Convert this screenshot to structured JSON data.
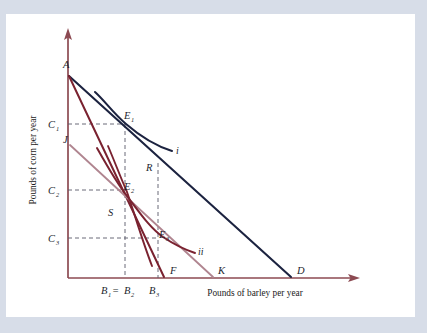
{
  "figure": {
    "type": "economics-indifference-curve-diagram",
    "axes": {
      "y_label": "Pounds of corn per year",
      "x_label": "Pounds of barley per year",
      "axis_color": "#8c4a52",
      "y_ticks": [
        {
          "id": "C1",
          "base": "C",
          "sub": "1"
        },
        {
          "id": "C2",
          "base": "C",
          "sub": "2"
        },
        {
          "id": "C3",
          "base": "C",
          "sub": "3"
        }
      ],
      "x_ticks": [
        {
          "id": "B1B2",
          "base": "B",
          "sub": "1",
          "eq": " = ",
          "base2": "B",
          "sub2": "2"
        },
        {
          "id": "B3",
          "base": "B",
          "sub": "3"
        }
      ]
    },
    "colors": {
      "budget_AD": "#1c2340",
      "budget_AF": "#7a2230",
      "budget_JK": "#b08590",
      "curve_i": "#1c2340",
      "curve_ii": "#7a2230",
      "dashed": "#5a5a6a",
      "axis": "#8c4a52",
      "frame": "#d7dde8",
      "page": "#ffffff"
    },
    "points": [
      {
        "id": "A",
        "base": "A",
        "sub": ""
      },
      {
        "id": "D",
        "base": "D",
        "sub": ""
      },
      {
        "id": "F",
        "base": "F",
        "sub": ""
      },
      {
        "id": "J",
        "base": "J",
        "sub": ""
      },
      {
        "id": "K",
        "base": "K",
        "sub": ""
      },
      {
        "id": "R",
        "base": "R",
        "sub": ""
      },
      {
        "id": "S",
        "base": "S",
        "sub": ""
      },
      {
        "id": "E1",
        "base": "E",
        "sub": "1"
      },
      {
        "id": "E2",
        "base": "E",
        "sub": "2"
      },
      {
        "id": "E3",
        "base": "E",
        "sub": "3"
      }
    ],
    "curve_labels": [
      {
        "id": "i",
        "text": "i"
      },
      {
        "id": "ii",
        "text": "ii"
      }
    ]
  },
  "labels": {
    "A": "A",
    "D": "D",
    "F": "F",
    "J": "J",
    "K": "K",
    "R": "R",
    "S": "S",
    "E": "E",
    "B": "B",
    "C": "C",
    "one": "1",
    "two": "2",
    "three": "3",
    "eq": " = ",
    "curve_i": "i",
    "curve_ii": "ii",
    "y_axis": "Pounds of corn per year",
    "x_axis": "Pounds of barley per year"
  }
}
